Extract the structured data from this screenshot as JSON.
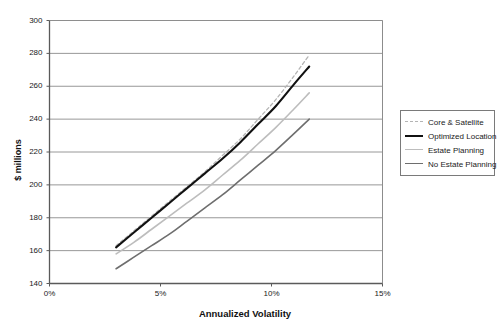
{
  "chart_data": {
    "type": "line",
    "title": "",
    "xlabel": "Annualized Volatility",
    "ylabel": "$ millions",
    "xlim": [
      0,
      15
    ],
    "ylim": [
      140,
      300
    ],
    "xticks": [
      "0%",
      "5%",
      "10%",
      "15%"
    ],
    "xtick_values": [
      0,
      5,
      10,
      15
    ],
    "yticks": [
      "140",
      "160",
      "180",
      "200",
      "220",
      "240",
      "260",
      "280",
      "300"
    ],
    "ytick_values": [
      140,
      160,
      180,
      200,
      220,
      240,
      260,
      280,
      300
    ],
    "grid": "horizontal",
    "legend_position": "right",
    "series": [
      {
        "name": "Core & Satellite",
        "style": "dashed",
        "color": "#b4b4b4",
        "width": 1.3,
        "x": [
          3.0,
          3.8,
          4.6,
          5.4,
          6.2,
          7.0,
          7.8,
          8.6,
          9.4,
          10.2,
          11.0,
          11.7
        ],
        "y": [
          163,
          172,
          181,
          190,
          199,
          208,
          218,
          228,
          240,
          252,
          266,
          279
        ]
      },
      {
        "name": "Optimized Location",
        "style": "solid",
        "color": "#111111",
        "width": 2.1,
        "x": [
          3.0,
          3.8,
          4.6,
          5.4,
          6.2,
          7.0,
          7.8,
          8.6,
          9.4,
          10.2,
          11.0,
          11.7
        ],
        "y": [
          162,
          171,
          180,
          189,
          198,
          207,
          216,
          226,
          237,
          248,
          261,
          272
        ]
      },
      {
        "name": "Estate Planning",
        "style": "solid",
        "color": "#bdbdbd",
        "width": 1.6,
        "x": [
          3.0,
          3.8,
          4.6,
          5.4,
          6.2,
          7.0,
          7.8,
          8.6,
          9.4,
          10.2,
          11.0,
          11.7
        ],
        "y": [
          158,
          165,
          173,
          181,
          189,
          197,
          206,
          215,
          225,
          235,
          246,
          256
        ]
      },
      {
        "name": "No Estate Planning",
        "style": "solid",
        "color": "#6e6e6e",
        "width": 1.6,
        "x": [
          3.0,
          3.8,
          4.6,
          5.4,
          6.2,
          7.0,
          7.8,
          8.6,
          9.4,
          10.2,
          11.0,
          11.7
        ],
        "y": [
          149,
          156,
          163,
          170,
          178,
          186,
          194,
          203,
          212,
          221,
          231,
          240
        ]
      }
    ]
  },
  "axes": {
    "frame_color": "#7a7a7a",
    "grid_color": "#8c8c8c"
  }
}
